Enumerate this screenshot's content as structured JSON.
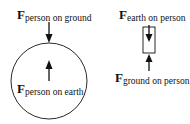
{
  "diagram": {
    "left": {
      "top_label": {
        "symbol": "F",
        "subscript": "person on ground"
      },
      "inner_label": {
        "symbol": "F",
        "subscript": "person on earth"
      },
      "body": "earth-circle"
    },
    "right": {
      "top_label": {
        "symbol": "F",
        "subscript": "earth on person"
      },
      "bottom_label": {
        "symbol": "F",
        "subscript": "ground on person"
      },
      "body": "person-rectangle"
    },
    "colors": {
      "stroke": "#111111",
      "background": "#ffffff"
    }
  }
}
